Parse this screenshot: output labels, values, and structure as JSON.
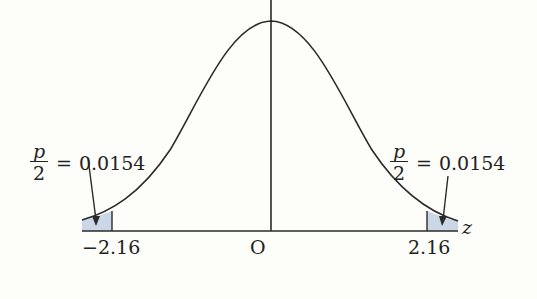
{
  "diagram": {
    "type": "normal-distribution-two-tailed",
    "axis_label": "z",
    "origin_label": "O",
    "left_critical": "−2.16",
    "right_critical": "2.16",
    "left_tail": {
      "fraction_numerator": "p",
      "fraction_denominator": "2",
      "equals": "=",
      "value": "0.0154"
    },
    "right_tail": {
      "fraction_numerator": "p",
      "fraction_denominator": "2",
      "equals": "=",
      "value": "0.0154"
    },
    "colors": {
      "curve": "#2a2a2a",
      "axis": "#2a2a2a",
      "shade": "#cbd6e6",
      "background": "#fdfdf9"
    }
  }
}
